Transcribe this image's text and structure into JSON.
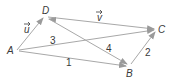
{
  "diagram": {
    "points": {
      "A": {
        "label": "A"
      },
      "B": {
        "label": "B"
      },
      "C": {
        "label": "C"
      },
      "D": {
        "label": "D"
      }
    },
    "vectors": [
      {
        "from": "A",
        "to": "D",
        "label": "u",
        "arrow": true
      },
      {
        "from": "D",
        "to": "C",
        "label": "v",
        "arrow": true
      },
      {
        "from": "A",
        "to": "C",
        "label": "3",
        "arrow": true
      },
      {
        "from": "C",
        "to": "D",
        "label": "",
        "arrow": true
      },
      {
        "from": "D",
        "to": "B",
        "label": "4",
        "arrow": true
      },
      {
        "from": "A",
        "to": "B",
        "label": "1",
        "arrow": true
      },
      {
        "from": "B",
        "to": "C",
        "label": "2",
        "arrow": true
      }
    ],
    "labels": {
      "A": "A",
      "B": "B",
      "C": "C",
      "D": "D",
      "u": "u",
      "v": "v",
      "n1": "1",
      "n2": "2",
      "n3": "3",
      "n4": "4"
    },
    "colors": {
      "line": "#a8a8a8",
      "text": "#3a3a3a"
    }
  }
}
